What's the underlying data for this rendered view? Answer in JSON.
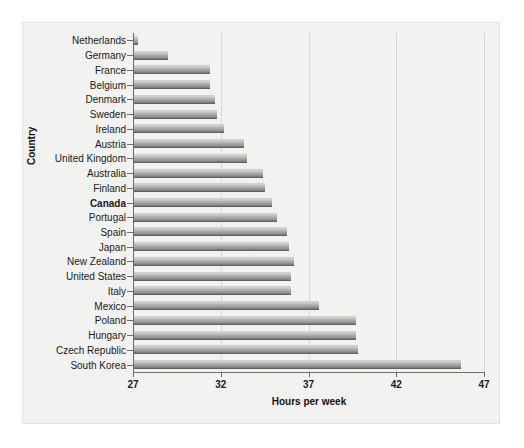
{
  "chart_data": {
    "type": "bar",
    "orientation": "horizontal",
    "title": "",
    "xlabel": "Hours per week",
    "ylabel": "Country",
    "xlim": [
      27,
      47
    ],
    "xticks": [
      27,
      32,
      37,
      42,
      47
    ],
    "grid": true,
    "legend": null,
    "highlight_category": "Canada",
    "categories": [
      "Netherlands",
      "Germany",
      "France",
      "Belgium",
      "Denmark",
      "Sweden",
      "Ireland",
      "Austria",
      "United Kingdom",
      "Australia",
      "Finland",
      "Canada",
      "Portugal",
      "Spain",
      "Japan",
      "New Zealand",
      "United States",
      "Italy",
      "Mexico",
      "Poland",
      "Hungary",
      "Czech Republic",
      "South Korea"
    ],
    "values": [
      27.3,
      29.0,
      31.4,
      31.4,
      31.7,
      31.8,
      32.2,
      33.3,
      33.5,
      34.4,
      34.5,
      34.9,
      35.2,
      35.8,
      35.9,
      36.2,
      36.0,
      36.0,
      37.6,
      39.7,
      39.7,
      39.8,
      45.7
    ]
  },
  "style": {
    "panel_background": "#f2f2f0",
    "figure_background": "#ffffff",
    "bar_light": "#d9d9d9",
    "bar_dark": "#4a4a4a",
    "axis_color": "#6b6b6b",
    "gridline_color": "#d7d7d5",
    "text_color": "#1a1a1a"
  }
}
